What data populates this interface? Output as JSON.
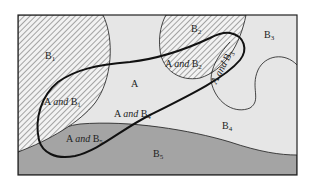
{
  "diagram": {
    "type": "venn-partition",
    "colors": {
      "background_light": "#e6e6e6",
      "dark_region": "#a4a4a4",
      "hatch": "#555555",
      "outline": "#1a1a1a"
    },
    "labels": {
      "b1": {
        "base": "B",
        "sub": "1"
      },
      "b2": {
        "base": "B",
        "sub": "2"
      },
      "b3": {
        "base": "B",
        "sub": "3"
      },
      "b4": {
        "base": "B",
        "sub": "4"
      },
      "b5": {
        "base": "B",
        "sub": "5"
      },
      "a": {
        "base": "A"
      },
      "a_b1": {
        "pre": "A ",
        "and": "and",
        "base": " B",
        "sub": "1"
      },
      "a_b2": {
        "pre": "A ",
        "and": "and",
        "base": " B",
        "sub": "2"
      },
      "a_b3": {
        "pre": "A ",
        "and": "and",
        "base": " B",
        "sub": "3"
      },
      "a_b4": {
        "pre": "A ",
        "and": "and",
        "base": " B",
        "sub": "4"
      },
      "a_b5": {
        "pre": "A ",
        "and": "and",
        "base": " B",
        "sub": "5"
      }
    }
  }
}
